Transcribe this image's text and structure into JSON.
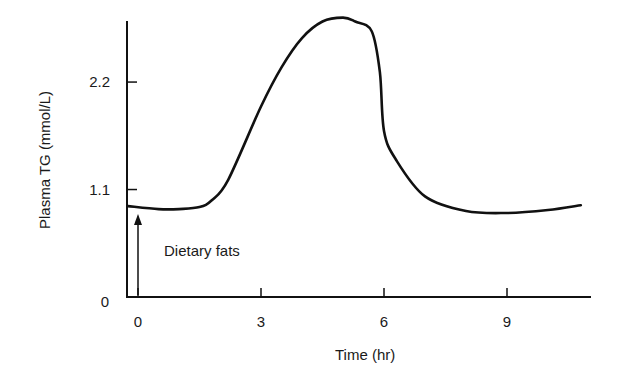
{
  "chart_data": {
    "type": "line",
    "title": "",
    "xlabel": "Time (hr)",
    "ylabel": "Plasma TG (mmol/L)",
    "xlim": [
      -0.27,
      10.9
    ],
    "ylim": [
      0,
      2.9
    ],
    "x_ticks": [
      0,
      3,
      6,
      9
    ],
    "x_tick_labels": [
      "0",
      "3",
      "6",
      "9"
    ],
    "y_ticks": [
      0,
      1.1,
      2.2
    ],
    "y_tick_labels": [
      "0",
      "1.1",
      "2.2"
    ],
    "grid": false,
    "legend": null,
    "series": [
      {
        "name": "Plasma TG",
        "x": [
          0,
          0.5,
          1,
          1.5,
          1.8,
          2.2,
          3,
          3.5,
          4,
          4.5,
          5,
          5.3,
          5.7,
          5.9,
          6.0,
          6.3,
          7,
          8,
          9,
          10,
          10.8
        ],
        "values": [
          0.93,
          0.9,
          0.9,
          0.92,
          0.99,
          1.2,
          1.95,
          2.35,
          2.65,
          2.82,
          2.86,
          2.82,
          2.72,
          2.3,
          1.7,
          1.4,
          1.03,
          0.88,
          0.86,
          0.89,
          0.94
        ]
      }
    ],
    "annotations": [
      {
        "text": "Dietary fats",
        "type": "arrow",
        "x": 0,
        "y_from": 0,
        "y_to": 0.85
      }
    ]
  },
  "labels": {
    "xlabel": "Time (hr)",
    "ylabel": "Plasma TG (mmol/L)",
    "annotation": "Dietary fats",
    "x_ticks": [
      "0",
      "3",
      "6",
      "9"
    ],
    "y_ticks": [
      "0",
      "1.1",
      "2.2"
    ]
  }
}
